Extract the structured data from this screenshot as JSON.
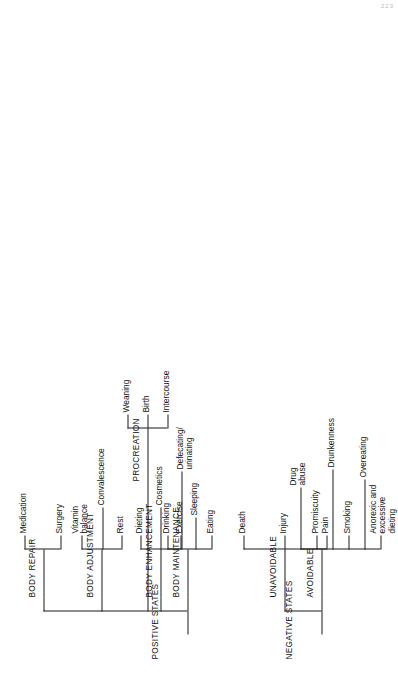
{
  "figure": {
    "page_number": "223",
    "orientation": "rotated-90-ccw",
    "line_color": "#1a1a1a",
    "background": "#ffffff"
  },
  "tree": {
    "positive": {
      "root_label": "POSITIVE STATES",
      "branches": [
        {
          "label": "BODY MAINTENANCE",
          "leaves": [
            "Eating",
            "Sleeping",
            "Drinking",
            "Defecating/\nurinating"
          ]
        },
        {
          "label": "BODY ENHANCEMENT",
          "leaves": [
            "Exercise",
            "Cosmetics",
            "Dieting"
          ]
        },
        {
          "label": "PROCREATION",
          "leaves": [
            "Intercourse",
            "Birth",
            "Weaning"
          ]
        },
        {
          "label": "BODY ADJUSTMENT",
          "leaves": [
            "Rest",
            "Convalescence",
            "Vitamin\nbalance"
          ]
        },
        {
          "label": "BODY REPAIR",
          "leaves": [
            "Surgery",
            "Medication"
          ]
        }
      ]
    },
    "negative": {
      "root_label": "NEGATIVE STATES",
      "branches": [
        {
          "label": "AVOIDABLE",
          "leaves": [
            "Anorexic and\nexcessive\ndieting",
            "Overeating",
            "Smoking",
            "Drunkenness",
            "Promiscuity",
            "Drug\nabuse"
          ]
        },
        {
          "label": "UNAVOIDABLE",
          "leaves": [
            "Pain",
            "Injury",
            "Death"
          ]
        }
      ]
    }
  },
  "labels": {
    "positive_states": "POSITIVE STATES",
    "negative_states": "NEGATIVE STATES",
    "body_maintenance": "BODY MAINTENANCE",
    "body_enhancement": "BODY ENHANCEMENT",
    "procreation": "PROCREATION",
    "body_adjustment": "BODY ADJUSTMENT",
    "body_repair": "BODY REPAIR",
    "avoidable": "AVOIDABLE",
    "unavoidable": "UNAVOIDABLE",
    "eating": "Eating",
    "sleeping": "Sleeping",
    "drinking": "Drinking",
    "defecating": "Defecating/\nurinating",
    "exercise": "Exercise",
    "cosmetics": "Cosmetics",
    "dieting": "Dieting",
    "intercourse": "Intercourse",
    "birth": "Birth",
    "weaning": "Weaning",
    "rest": "Rest",
    "convalescence": "Convalescence",
    "vitamin_balance": "Vitamin\nbalance",
    "surgery": "Surgery",
    "medication": "Medication",
    "anorexic": "Anorexic and\nexcessive\ndieting",
    "overeating": "Overeating",
    "smoking": "Smoking",
    "drunkenness": "Drunkenness",
    "promiscuity": "Promiscuity",
    "drug_abuse": "Drug\nabuse",
    "pain": "Pain",
    "injury": "Injury",
    "death": "Death",
    "page_number": "223"
  }
}
